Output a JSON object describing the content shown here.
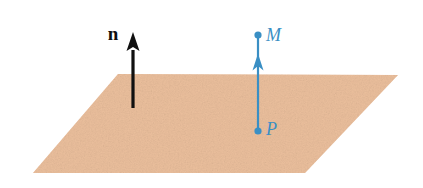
{
  "figure": {
    "background_color": "#ffffff",
    "width": 423,
    "height": 188
  },
  "plane": {
    "name": "plane",
    "fill_color": "#F2C9A8",
    "texture": "grainy-speckle",
    "corners": [
      {
        "x": 118,
        "y": 74
      },
      {
        "x": 398,
        "y": 75
      },
      {
        "x": 305,
        "y": 173
      },
      {
        "x": 33,
        "y": 173
      }
    ]
  },
  "normal_vector": {
    "name": "normal-vector-n",
    "label": "n",
    "label_style": "bold-serif",
    "color": "#101010",
    "label_color": "#101010",
    "tail": {
      "x": 133,
      "y": 108
    },
    "head": {
      "x": 133,
      "y": 32
    },
    "label_position": {
      "x": 113,
      "y": 40
    },
    "line_width": 3.2,
    "arrow_width": 13,
    "arrow_length": 19
  },
  "segment_PM": {
    "name": "segment-p-to-m",
    "color": "#3A8FC4",
    "line_width": 2.2,
    "start_point": {
      "x": 258,
      "y": 131
    },
    "end_point": {
      "x": 258,
      "y": 35
    },
    "arrow_position": {
      "x": 258,
      "y": 62
    },
    "arrow_width": 11,
    "arrow_length": 17
  },
  "points": [
    {
      "name": "point-m",
      "label": "M",
      "label_style": "italic-serif",
      "color": "#3A8FC4",
      "x": 258,
      "y": 35,
      "radius": 3.6,
      "label_position": {
        "x": 266,
        "y": 41
      }
    },
    {
      "name": "point-p",
      "label": "P",
      "label_style": "italic-serif",
      "color": "#3A8FC4",
      "x": 258,
      "y": 131,
      "radius": 3.6,
      "label_position": {
        "x": 266,
        "y": 135
      }
    }
  ],
  "colors": {
    "plane_tan": "#F2C9A8",
    "plane_tan_dark": "#E8B893",
    "accent_blue": "#3A8FC4",
    "vector_black": "#101010",
    "background": "#ffffff"
  }
}
